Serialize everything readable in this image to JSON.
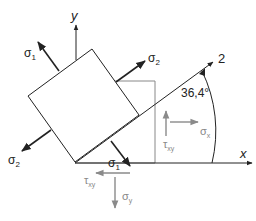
{
  "diagram": {
    "title": "",
    "type": "plane-stress-element-rotated",
    "axes": {
      "x_label": "x",
      "y_label": "y",
      "principal_axis_label": "2"
    },
    "angle": {
      "value": "36,4°"
    },
    "principal_stresses": {
      "sigma1_top": {
        "symbol": "σ",
        "subscript": "1"
      },
      "sigma1_bottom": {
        "symbol": "σ",
        "subscript": "1"
      },
      "sigma2_right": {
        "symbol": "σ",
        "subscript": "2"
      },
      "sigma2_left": {
        "symbol": "σ",
        "subscript": "2"
      }
    },
    "reference_stresses": {
      "sigma_x": {
        "symbol": "σ",
        "subscript": "x"
      },
      "sigma_y": {
        "symbol": "σ",
        "subscript": "y"
      },
      "tau_xy_right": {
        "symbol": "τ",
        "subscript": "xy"
      },
      "tau_xy_bottom": {
        "symbol": "τ",
        "subscript": "xy"
      }
    },
    "colors": {
      "principal": "#222222",
      "reference": "#8a8a8a"
    }
  }
}
